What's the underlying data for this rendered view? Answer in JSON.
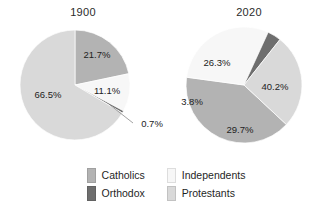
{
  "figure": {
    "background": "#ffffff",
    "width": 332,
    "height": 215
  },
  "charts": [
    {
      "title": "1900",
      "labels": [
        "21.7%",
        "11.1%",
        "0.7%",
        "66.5%"
      ]
    },
    {
      "title": "2020",
      "labels": [
        "40.2%",
        "29.7%",
        "3.8%",
        "26.3%"
      ]
    }
  ],
  "legend": {
    "position": "bottom-center",
    "columns": 2,
    "items": [
      {
        "label": "Catholics",
        "color": "#b3b3b3"
      },
      {
        "label": "Independents",
        "color": "#f7f7f7"
      },
      {
        "label": "Orthodox",
        "color": "#6e6e6e"
      },
      {
        "label": "Protestants",
        "color": "#d9d9d9"
      }
    ]
  },
  "chart_data": [
    {
      "type": "pie",
      "title": "1900",
      "categories": [
        "Catholics",
        "Independents",
        "Orthodox",
        "Protestants"
      ],
      "values": [
        21.7,
        11.1,
        0.7,
        66.5
      ],
      "value_labels": [
        "21.7%",
        "11.1%",
        "0.7%",
        "66.5%"
      ],
      "colors": [
        "#b3b3b3",
        "#f7f7f7",
        "#6e6e6e",
        "#d9d9d9"
      ],
      "units": "percent",
      "start_angle_deg": 0,
      "direction": "clockwise",
      "xlabel": "",
      "ylabel": "",
      "legend": "shared-bottom",
      "grid": false
    },
    {
      "type": "pie",
      "title": "2020",
      "categories": [
        "Catholics",
        "Independents",
        "Orthodox",
        "Protestants"
      ],
      "values": [
        40.2,
        29.7,
        3.8,
        26.3
      ],
      "value_labels": [
        "40.2%",
        "29.7%",
        "3.8%",
        "26.3%"
      ],
      "colors": [
        "#b3b3b3",
        "#f7f7f7",
        "#6e6e6e",
        "#d9d9d9"
      ],
      "units": "percent",
      "start_angle_deg": 0,
      "direction": "clockwise",
      "xlabel": "",
      "ylabel": "",
      "legend": "shared-bottom",
      "grid": false
    }
  ]
}
